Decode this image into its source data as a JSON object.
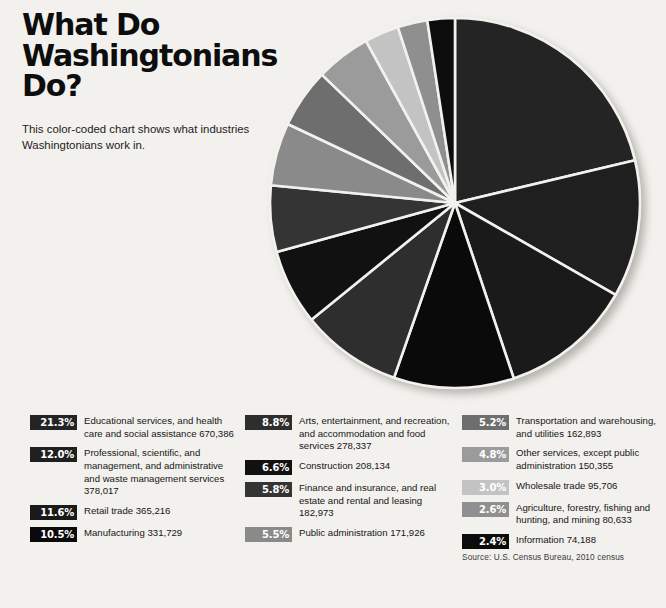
{
  "header": {
    "title": "What Do\nWashingtonians\nDo?",
    "subtitle": "This color-coded chart shows what industries Washingtonians work in."
  },
  "source": "Source: U.S. Census Bureau, 2010 census",
  "legend_columns": [
    {
      "start": 0,
      "end": 4
    },
    {
      "start": 4,
      "end": 8
    },
    {
      "start": 8,
      "end": 13
    }
  ],
  "chart_data": {
    "type": "pie",
    "title": "What Do Washingtonians Do?",
    "subtitle": "This color-coded chart shows what industries Washingtonians work in.",
    "source": "Source: U.S. Census Bureau, 2010 census",
    "unit": "percent of workforce",
    "start_angle_deg": 0,
    "direction": "clockwise",
    "legend_position": "bottom",
    "total_employment": 3145441,
    "categories": [
      "Educational services, and health care and social assistance",
      "Professional, scientific, and management, and administrative and waste management services",
      "Retail trade",
      "Manufacturing",
      "Arts, entertainment, and recreation, and accommodation and food services",
      "Construction",
      "Finance and insurance, and real estate and rental and leasing",
      "Public administration",
      "Transportation and warehousing, and utilities",
      "Other services, except public administration",
      "Wholesale trade",
      "Agriculture, forestry, fishing and hunting, and mining",
      "Information"
    ],
    "values": [
      21.3,
      12.0,
      11.6,
      10.5,
      8.8,
      6.6,
      5.8,
      5.5,
      5.2,
      4.8,
      3.0,
      2.6,
      2.4
    ],
    "counts": [
      670386,
      378017,
      365216,
      331729,
      278337,
      208134,
      182973,
      171926,
      162893,
      150355,
      95706,
      80633,
      74188
    ],
    "colors": [
      "#242424",
      "#1f1f1f",
      "#1a1a1a",
      "#0a0a0a",
      "#2e2e2e",
      "#111111",
      "#343434",
      "#8a8a8a",
      "#6e6e6e",
      "#9b9b9b",
      "#c3c3c3",
      "#8f8f8f",
      "#0c0c0c"
    ],
    "slice_text_colors": [
      "#ffffff",
      "#ffffff",
      "#ffffff",
      "#ffffff",
      "#ffffff",
      "#ffffff",
      "#ffffff",
      "#ffffff",
      "#ffffff",
      "#ffffff",
      "#ffffff",
      "#ffffff",
      "#ffffff"
    ]
  },
  "items": [
    {
      "pct": "21.3%",
      "pct_num": "21.3",
      "label": "Educational services, and health care and social assistance 670,386",
      "color": "#242424",
      "text_color": "#ffffff"
    },
    {
      "pct": "12.0%",
      "pct_num": "12.0",
      "label": "Professional, scientific, and management, and administrative and waste management services 378,017",
      "color": "#1f1f1f",
      "text_color": "#ffffff"
    },
    {
      "pct": "11.6%",
      "pct_num": "11.6",
      "label": "Retail trade 365,216",
      "color": "#1a1a1a",
      "text_color": "#ffffff"
    },
    {
      "pct": "10.5%",
      "pct_num": "10.5",
      "label": "Manufacturing 331,729",
      "color": "#0a0a0a",
      "text_color": "#ffffff"
    },
    {
      "pct": "8.8%",
      "pct_num": "8.8",
      "label": "Arts, entertainment, and recreation, and accommodation and food services 278,337",
      "color": "#2e2e2e",
      "text_color": "#ffffff"
    },
    {
      "pct": "6.6%",
      "pct_num": "6.6",
      "label": "Construction 208,134",
      "color": "#111111",
      "text_color": "#ffffff"
    },
    {
      "pct": "5.8%",
      "pct_num": "5.8",
      "label": "Finance and insurance, and real estate and rental and leasing 182,973",
      "color": "#343434",
      "text_color": "#ffffff"
    },
    {
      "pct": "5.5%",
      "pct_num": "5.5",
      "label": "Public administration 171,926",
      "color": "#8a8a8a",
      "text_color": "#ffffff"
    },
    {
      "pct": "5.2%",
      "pct_num": "5.2",
      "label": "Transportation and warehousing, and utilities 162,893",
      "color": "#6e6e6e",
      "text_color": "#ffffff"
    },
    {
      "pct": "4.8%",
      "pct_num": "4.8",
      "label": "Other services, except public administration 150,355",
      "color": "#9b9b9b",
      "text_color": "#ffffff"
    },
    {
      "pct": "3.0%",
      "pct_num": "3.0",
      "label": "Wholesale trade 95,706",
      "color": "#c3c3c3",
      "text_color": "#ffffff"
    },
    {
      "pct": "2.6%",
      "pct_num": "2.6",
      "label": "Agriculture, forestry, fishing and hunting, and mining 80,633",
      "color": "#8f8f8f",
      "text_color": "#ffffff"
    },
    {
      "pct": "2.4%",
      "pct_num": "2.4",
      "label": "Information 74,188",
      "color": "#0c0c0c",
      "text_color": "#ffffff"
    }
  ]
}
